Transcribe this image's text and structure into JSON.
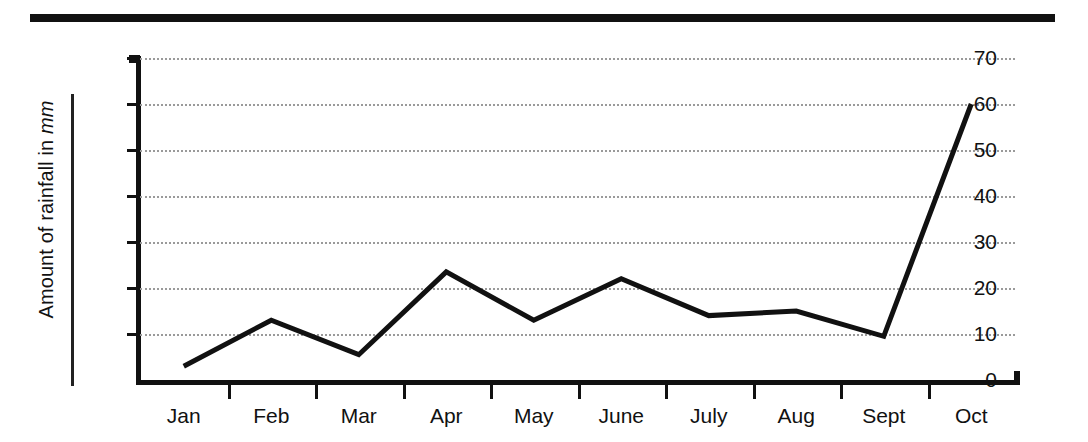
{
  "figure": {
    "top_rule": "horizontal-rule",
    "background_color": "#ffffff",
    "ink_color": "#111111",
    "gridline_color": "#9a9a9a"
  },
  "chart_data": {
    "type": "line",
    "title": "",
    "xlabel": "",
    "ylabel": "Amount of rainfall in mm",
    "ylabel_plain": "Amount of rainfall in ",
    "ylabel_unit": "mm",
    "categories": [
      "Jan",
      "Feb",
      "Mar",
      "Apr",
      "May",
      "June",
      "July",
      "Aug",
      "Sept",
      "Oct"
    ],
    "values": [
      3,
      13,
      5.5,
      23.5,
      13,
      22,
      14,
      15,
      9.5,
      60
    ],
    "ylim": [
      0,
      70
    ],
    "ytick_values": [
      0,
      10,
      20,
      30,
      40,
      50,
      60,
      70
    ],
    "ytick_labels": [
      "0",
      "10",
      "20",
      "30",
      "40",
      "50",
      "60",
      "70"
    ],
    "grid": true,
    "grid_axis": "y",
    "grid_style": "dotted",
    "legend": "none",
    "line_color": "#111111",
    "line_width": 5,
    "markers": "none"
  }
}
